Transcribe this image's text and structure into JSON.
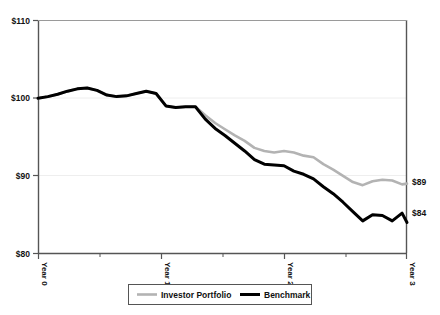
{
  "chart_data": {
    "type": "line",
    "title": "",
    "xlabel": "",
    "ylabel": "",
    "ylim": [
      80,
      110
    ],
    "xlim": [
      0,
      3
    ],
    "grid": true,
    "grid_axis": "y",
    "legend_position": "bottom",
    "y_ticks": [
      "$80",
      "$90",
      "$100",
      "$110"
    ],
    "y_tick_values": [
      80,
      90,
      100,
      110
    ],
    "x_ticks": [
      "Year 0",
      "Year 1",
      "Year 2",
      "Year 3"
    ],
    "x_tick_values": [
      0,
      1,
      2,
      3
    ],
    "x_minor_ticks": [
      0.5,
      1.5,
      2.5
    ],
    "end_labels": [
      {
        "text": "$89",
        "value": 89,
        "series": "Investor Portfolio"
      },
      {
        "text": "$84",
        "value": 84,
        "series": "Benchmark"
      }
    ],
    "series": [
      {
        "name": "Investor Portfolio",
        "color": "#b3b3b3",
        "width": 2.6,
        "x": [
          0,
          0.08,
          0.16,
          0.24,
          0.32,
          0.4,
          0.48,
          0.56,
          0.64,
          0.72,
          0.8,
          0.88,
          0.96,
          1.04,
          1.12,
          1.2,
          1.28,
          1.36,
          1.44,
          1.52,
          1.6,
          1.68,
          1.76,
          1.84,
          1.92,
          2.0,
          2.08,
          2.16,
          2.24,
          2.32,
          2.4,
          2.48,
          2.56,
          2.64,
          2.72,
          2.8,
          2.88,
          2.96,
          3.0
        ],
        "values": [
          100.0,
          100.2,
          100.5,
          100.9,
          101.2,
          101.3,
          101.0,
          100.4,
          100.2,
          100.3,
          100.6,
          100.9,
          100.6,
          99.0,
          98.8,
          98.9,
          98.9,
          97.8,
          96.8,
          96.0,
          95.2,
          94.5,
          93.6,
          93.2,
          93.0,
          93.2,
          93.0,
          92.6,
          92.4,
          91.5,
          90.8,
          90.0,
          89.2,
          88.8,
          89.3,
          89.5,
          89.4,
          88.9,
          89.0
        ]
      },
      {
        "name": "Benchmark",
        "color": "#000000",
        "width": 3.0,
        "x": [
          0,
          0.08,
          0.16,
          0.24,
          0.32,
          0.4,
          0.48,
          0.56,
          0.64,
          0.72,
          0.8,
          0.88,
          0.96,
          1.04,
          1.12,
          1.2,
          1.28,
          1.36,
          1.44,
          1.52,
          1.6,
          1.68,
          1.76,
          1.84,
          1.92,
          2.0,
          2.08,
          2.16,
          2.24,
          2.32,
          2.4,
          2.48,
          2.56,
          2.64,
          2.72,
          2.8,
          2.88,
          2.96,
          3.0
        ],
        "values": [
          100.0,
          100.2,
          100.5,
          100.9,
          101.2,
          101.3,
          101.0,
          100.4,
          100.2,
          100.3,
          100.6,
          100.9,
          100.6,
          99.0,
          98.8,
          98.9,
          98.9,
          97.3,
          96.1,
          95.2,
          94.2,
          93.2,
          92.1,
          91.5,
          91.4,
          91.3,
          90.6,
          90.2,
          89.6,
          88.6,
          87.7,
          86.6,
          85.4,
          84.2,
          85.0,
          84.9,
          84.2,
          85.2,
          84.0
        ]
      }
    ],
    "legend": [
      {
        "label": "Investor Portfolio",
        "color": "#b3b3b3"
      },
      {
        "label": "Benchmark",
        "color": "#000000"
      }
    ]
  },
  "axis_colors": {
    "axis_line": "#555555",
    "grid_line": "#e8e8e8",
    "tick": "#555555",
    "legend_border": "#555555",
    "text": "#111111"
  }
}
